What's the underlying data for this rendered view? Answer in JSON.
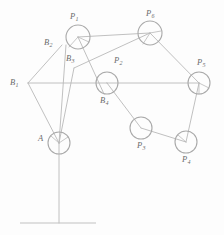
{
  "figure": {
    "background_color": "#fdfdfd",
    "line_color": "#b9b9b9",
    "joint_stroke_color": "#a9a9a9",
    "label_color": "#6b6b6b",
    "ground_color": "#c2c2c2",
    "width": 224,
    "height": 235
  },
  "joints": [
    {
      "id": "P1",
      "label": "P",
      "sub": "1",
      "cx": 78,
      "cy": 37,
      "r": 12,
      "label_x": 70,
      "label_y": 12
    },
    {
      "id": "P6",
      "label": "P",
      "sub": "6",
      "cx": 150,
      "cy": 33,
      "r": 12,
      "label_x": 146,
      "label_y": 9
    },
    {
      "id": "P5",
      "label": "P",
      "sub": "5",
      "cx": 199,
      "cy": 83,
      "r": 11,
      "label_x": 197,
      "label_y": 58
    },
    {
      "id": "B4",
      "label": "B",
      "sub": "4",
      "cx": 107,
      "cy": 83,
      "r": 11,
      "label_x": 100,
      "label_y": 96
    },
    {
      "id": "P3",
      "label": "P",
      "sub": "3",
      "cx": 141,
      "cy": 128,
      "r": 11,
      "label_x": 137,
      "label_y": 141
    },
    {
      "id": "P4",
      "label": "P",
      "sub": "4",
      "cx": 186,
      "cy": 142,
      "r": 11,
      "label_x": 182,
      "label_y": 155
    },
    {
      "id": "A",
      "label": "A",
      "sub": "",
      "cx": 59,
      "cy": 143,
      "r": 11,
      "label_x": 38,
      "label_y": 134
    }
  ],
  "vertices": [
    {
      "id": "B1",
      "label": "B",
      "sub": "1",
      "x": 28,
      "y": 83,
      "label_x": 10,
      "label_y": 78
    },
    {
      "id": "B2",
      "label": "B",
      "sub": "2",
      "x": 62,
      "y": 45,
      "label_x": 44,
      "label_y": 38
    },
    {
      "id": "B3",
      "label": "B",
      "sub": "3",
      "x": 74,
      "y": 68,
      "label_x": 66,
      "label_y": 54
    },
    {
      "id": "P2",
      "label": "P",
      "sub": "2",
      "x": 0,
      "y": 0,
      "label_x": 114,
      "label_y": 56
    }
  ],
  "links": [
    {
      "name": "B1-B2",
      "x1": 28,
      "y1": 83,
      "x2": 62,
      "y2": 45
    },
    {
      "name": "B1-A",
      "x1": 28,
      "y1": 83,
      "x2": 59,
      "y2": 143
    },
    {
      "name": "B1-B4",
      "x1": 28,
      "y1": 83,
      "x2": 107,
      "y2": 83
    },
    {
      "name": "B4-P5",
      "x1": 107,
      "y1": 83,
      "x2": 199,
      "y2": 83
    },
    {
      "name": "A-B2",
      "x1": 59,
      "y1": 143,
      "x2": 66,
      "y2": 45
    },
    {
      "name": "A-B3",
      "x1": 59,
      "y1": 143,
      "x2": 74,
      "y2": 68
    },
    {
      "name": "P1-P6",
      "x1": 78,
      "y1": 37,
      "x2": 150,
      "y2": 33
    },
    {
      "name": "P1-B4",
      "x1": 78,
      "y1": 37,
      "x2": 104,
      "y2": 94
    },
    {
      "name": "B3-P6",
      "x1": 74,
      "y1": 68,
      "x2": 150,
      "y2": 33
    },
    {
      "name": "P6-P5",
      "x1": 150,
      "y1": 33,
      "x2": 199,
      "y2": 83
    },
    {
      "name": "B4-P3",
      "x1": 107,
      "y1": 83,
      "x2": 141,
      "y2": 128
    },
    {
      "name": "P3-P4",
      "x1": 141,
      "y1": 128,
      "x2": 186,
      "y2": 142
    },
    {
      "name": "P5-P4",
      "x1": 199,
      "y1": 83,
      "x2": 186,
      "y2": 142
    },
    {
      "name": "A-ground-post",
      "x1": 59,
      "y1": 143,
      "x2": 59,
      "y2": 223
    }
  ],
  "hatch_marks": [
    {
      "name": "P1-hatch-a",
      "x1": 78,
      "y1": 37,
      "x2": 69,
      "y2": 47
    },
    {
      "name": "P1-hatch-b",
      "x1": 78,
      "y1": 37,
      "x2": 89,
      "y2": 42
    },
    {
      "name": "P6-hatch-a",
      "x1": 150,
      "y1": 33,
      "x2": 143,
      "y2": 44
    },
    {
      "name": "P6-hatch-b",
      "x1": 150,
      "y1": 33,
      "x2": 161,
      "y2": 31
    },
    {
      "name": "P5-hatch-a",
      "x1": 199,
      "y1": 83,
      "x2": 199,
      "y2": 94
    },
    {
      "name": "P5-hatch-b",
      "x1": 199,
      "y1": 83,
      "x2": 209,
      "y2": 88
    },
    {
      "name": "P4-hatch-a",
      "x1": 186,
      "y1": 142,
      "x2": 178,
      "y2": 135
    },
    {
      "name": "A-hatch-a",
      "x1": 59,
      "y1": 143,
      "x2": 51,
      "y2": 136
    },
    {
      "name": "A-hatch-b",
      "x1": 59,
      "y1": 143,
      "x2": 68,
      "y2": 137
    }
  ],
  "ground": {
    "name": "ground-line",
    "x1": 20,
    "y1": 223,
    "x2": 96,
    "y2": 223
  }
}
